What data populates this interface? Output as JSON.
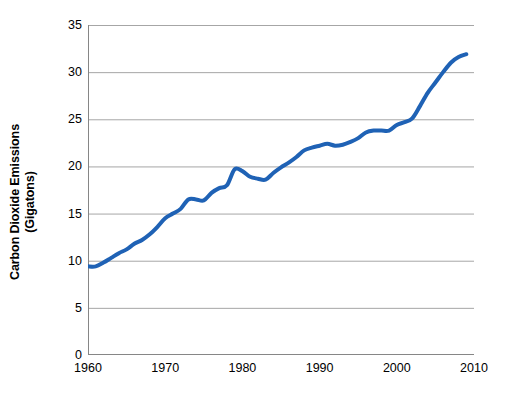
{
  "chart_data": {
    "type": "line",
    "title": "",
    "xlabel": "",
    "ylabel": "Carbon Dioxide Emissions (Gigatons)",
    "ylabel_lines": [
      "Carbon Dioxide Emissions",
      "(Gigatons)"
    ],
    "xlim": [
      1960,
      2010
    ],
    "ylim": [
      0,
      35
    ],
    "yticks": [
      0,
      5,
      10,
      15,
      20,
      25,
      30,
      35
    ],
    "ytick_labels": [
      "0",
      "5",
      "10",
      "15",
      "20",
      "25",
      "30",
      "35"
    ],
    "xticks": [
      1960,
      1970,
      1980,
      1990,
      2000,
      2010
    ],
    "xtick_labels": [
      "1960",
      "1970",
      "1980",
      "1990",
      "2000",
      "2010"
    ],
    "grid": "horizontal",
    "legend": "none",
    "series_color": "#1F62B5",
    "line_width": 4,
    "x": [
      1960,
      1961,
      1962,
      1963,
      1964,
      1965,
      1966,
      1967,
      1968,
      1969,
      1970,
      1971,
      1972,
      1973,
      1974,
      1975,
      1976,
      1977,
      1978,
      1979,
      1980,
      1981,
      1982,
      1983,
      1984,
      1985,
      1986,
      1987,
      1988,
      1989,
      1990,
      1991,
      1992,
      1993,
      1994,
      1995,
      1996,
      1997,
      1998,
      1999,
      2000,
      2001,
      2002,
      2003,
      2004,
      2005,
      2006,
      2007,
      2008,
      2009
    ],
    "values": [
      9.4,
      9.4,
      9.8,
      10.3,
      10.8,
      11.2,
      11.8,
      12.2,
      12.8,
      13.6,
      14.5,
      15.0,
      15.5,
      16.5,
      16.5,
      16.4,
      17.2,
      17.7,
      18.0,
      19.7,
      19.5,
      18.9,
      18.7,
      18.6,
      19.3,
      19.9,
      20.4,
      21.0,
      21.7,
      22.0,
      22.2,
      22.4,
      22.2,
      22.3,
      22.6,
      23.0,
      23.6,
      23.8,
      23.8,
      23.8,
      24.4,
      24.7,
      25.1,
      26.4,
      27.8,
      28.9,
      30.0,
      31.0,
      31.6,
      31.9
    ],
    "units": "Gigatons",
    "annotations": []
  }
}
